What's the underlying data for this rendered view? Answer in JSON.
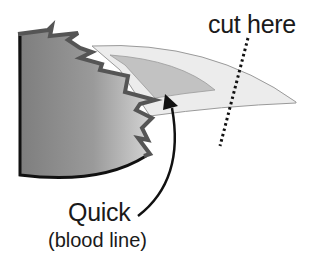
{
  "diagram": {
    "labels": {
      "cut_here": "cut here",
      "quick": "Quick",
      "blood_line": "(blood line)"
    },
    "parts": [
      {
        "name": "toe",
        "color": "#8c8c8c"
      },
      {
        "name": "nail",
        "color": "#e9e9e9"
      },
      {
        "name": "quick",
        "color": "#bdbdbd"
      },
      {
        "name": "cut-line",
        "color": "#111111",
        "style": "dotted"
      },
      {
        "name": "pointer-arrow",
        "color": "#111111"
      }
    ]
  }
}
